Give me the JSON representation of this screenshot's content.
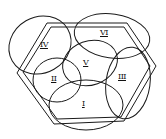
{
  "diagram": {
    "type": "hexagon-with-overlapping-ellipses",
    "stroke_color": "#1a1a1a",
    "background": "#ffffff",
    "regions": [
      {
        "id": "I",
        "label": "I",
        "x": 80,
        "y": 104
      },
      {
        "id": "II",
        "label": "II",
        "x": 52,
        "y": 80
      },
      {
        "id": "III",
        "label": "III",
        "x": 121,
        "y": 77
      },
      {
        "id": "IV",
        "label": "IV",
        "x": 39,
        "y": 43
      },
      {
        "id": "V",
        "label": "V",
        "x": 84,
        "y": 63
      },
      {
        "id": "VI",
        "label": "VI",
        "x": 102,
        "y": 33
      }
    ]
  }
}
